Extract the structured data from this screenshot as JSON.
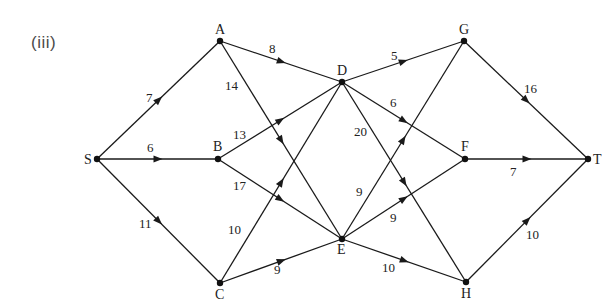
{
  "part_label": "(iii)",
  "colors": {
    "line": "#1a1a1a",
    "node": "#111111",
    "text": "#222222",
    "background": "#ffffff"
  },
  "nodes": [
    {
      "id": "S",
      "label": "S",
      "x": 97,
      "y": 159,
      "lx": -13,
      "ly": 5
    },
    {
      "id": "A",
      "label": "A",
      "x": 220,
      "y": 41,
      "lx": -5,
      "ly": -7
    },
    {
      "id": "B",
      "label": "B",
      "x": 218,
      "y": 159,
      "lx": -5,
      "ly": -8
    },
    {
      "id": "C",
      "label": "C",
      "x": 220,
      "y": 283,
      "lx": -5,
      "ly": 16
    },
    {
      "id": "D",
      "label": "D",
      "x": 342,
      "y": 82,
      "lx": -5,
      "ly": -7
    },
    {
      "id": "E",
      "label": "E",
      "x": 342,
      "y": 239,
      "lx": -5,
      "ly": 15
    },
    {
      "id": "F",
      "label": "F",
      "x": 465,
      "y": 159,
      "lx": -4,
      "ly": -8
    },
    {
      "id": "G",
      "label": "G",
      "x": 464,
      "y": 41,
      "lx": -5,
      "ly": -7
    },
    {
      "id": "H",
      "label": "H",
      "x": 466,
      "y": 282,
      "lx": -5,
      "ly": 16
    },
    {
      "id": "T",
      "label": "T",
      "x": 588,
      "y": 159,
      "lx": 5,
      "ly": 5
    }
  ],
  "edges": [
    {
      "from": "S",
      "to": "A",
      "weight": "7",
      "wx": 146,
      "wy": 102
    },
    {
      "from": "S",
      "to": "B",
      "weight": "6",
      "wx": 147,
      "wy": 152
    },
    {
      "from": "S",
      "to": "C",
      "weight": "11",
      "wx": 139,
      "wy": 228
    },
    {
      "from": "A",
      "to": "D",
      "weight": "8",
      "wx": 269,
      "wy": 53
    },
    {
      "from": "A",
      "to": "E",
      "weight": "14",
      "wx": 225,
      "wy": 90
    },
    {
      "from": "B",
      "to": "D",
      "weight": "13",
      "wx": 233,
      "wy": 139
    },
    {
      "from": "B",
      "to": "E",
      "weight": "17",
      "wx": 233,
      "wy": 190
    },
    {
      "from": "C",
      "to": "D",
      "weight": "10",
      "wx": 228,
      "wy": 234
    },
    {
      "from": "C",
      "to": "E",
      "weight": "9",
      "wx": 274,
      "wy": 274
    },
    {
      "from": "D",
      "to": "G",
      "weight": "5",
      "wx": 391,
      "wy": 60
    },
    {
      "from": "D",
      "to": "F",
      "weight": "6",
      "wx": 390,
      "wy": 107
    },
    {
      "from": "D",
      "to": "H",
      "weight": "20",
      "wx": 354,
      "wy": 136
    },
    {
      "from": "E",
      "to": "G",
      "weight": "9",
      "wx": 356,
      "wy": 196
    },
    {
      "from": "E",
      "to": "F",
      "weight": "9",
      "wx": 390,
      "wy": 222
    },
    {
      "from": "E",
      "to": "H",
      "weight": "10",
      "wx": 382,
      "wy": 272
    },
    {
      "from": "G",
      "to": "T",
      "weight": "16",
      "wx": 524,
      "wy": 93
    },
    {
      "from": "F",
      "to": "T",
      "weight": "7",
      "wx": 510,
      "wy": 176
    },
    {
      "from": "H",
      "to": "T",
      "weight": "10",
      "wx": 526,
      "wy": 239
    }
  ]
}
